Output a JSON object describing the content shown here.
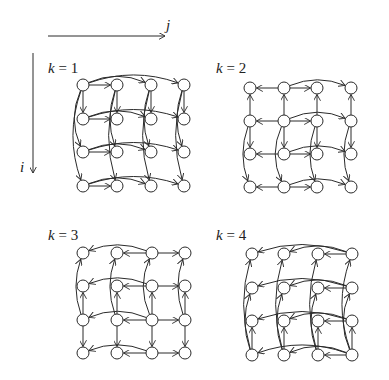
{
  "axes": {
    "j_label": "j",
    "i_label": "i",
    "j_arrow": {
      "x1": 48,
      "y1": 36,
      "x2": 165,
      "y2": 36,
      "label_x": 166,
      "label_y": 30
    },
    "i_arrow": {
      "x1": 33,
      "y1": 53,
      "x2": 33,
      "y2": 173,
      "label_x": 20,
      "label_y": 172
    }
  },
  "node_radius": 6,
  "panels": [
    {
      "id": "k1",
      "label": "k = 1",
      "label_pos": [
        48,
        73
      ],
      "cols": [
        83,
        117,
        151,
        184
      ],
      "rows": [
        85,
        119,
        152,
        186
      ],
      "pivot": 1
    },
    {
      "id": "k2",
      "label": "k = 2",
      "label_pos": [
        216,
        73
      ],
      "cols": [
        250,
        284,
        317,
        351
      ],
      "rows": [
        88,
        121,
        154,
        187
      ],
      "pivot": 2
    },
    {
      "id": "k3",
      "label": "k = 3",
      "label_pos": [
        48,
        240
      ],
      "cols": [
        83,
        117,
        152,
        185
      ],
      "rows": [
        253,
        286,
        320,
        353
      ],
      "pivot": 3
    },
    {
      "id": "k4",
      "label": "k = 4",
      "label_pos": [
        216,
        240
      ],
      "cols": [
        252,
        284,
        318,
        352
      ],
      "rows": [
        254,
        288,
        321,
        355
      ],
      "pivot": 4
    }
  ],
  "colors": {
    "stroke": "#2a2a2a",
    "background": "#ffffff"
  }
}
